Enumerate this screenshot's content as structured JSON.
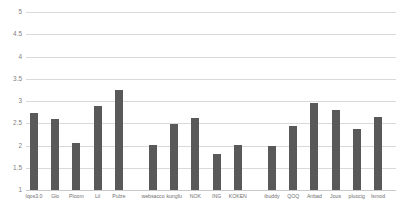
{
  "chart_data": {
    "type": "bar",
    "title": "",
    "subtitle": "",
    "xlabel": "",
    "ylabel": "",
    "ylim": [
      1,
      5
    ],
    "ytick_labels": [
      "1",
      "1.5",
      "2",
      "2.5",
      "3",
      "3.5",
      "4",
      "4.5",
      "5"
    ],
    "ytick_values": [
      1,
      1.5,
      2,
      2.5,
      3,
      3.5,
      4,
      4.5,
      5
    ],
    "grid": true,
    "legend": "none",
    "bar_color": "#595959",
    "gridline_color": "#d9d9d9",
    "background_color": "#ffffff",
    "groups": [
      {
        "name": "group-1",
        "categories": [
          "Iqos3.0",
          "Glo",
          "Ploom",
          "Lil",
          "Pulze"
        ],
        "values": [
          2.73,
          2.6,
          2.06,
          2.89,
          3.25
        ]
      },
      {
        "name": "group-2",
        "categories": [
          "websacco",
          "kungfu",
          "NOK",
          "ING",
          "KOKEN"
        ],
        "values": [
          2.01,
          2.48,
          2.62,
          1.82,
          2.01
        ]
      },
      {
        "name": "group-3",
        "categories": [
          "ibuddy",
          "QOQ",
          "Anbad",
          "Jous",
          "pluocig",
          "Ismod"
        ],
        "values": [
          2.0,
          2.44,
          2.96,
          2.79,
          2.36,
          2.63
        ]
      }
    ],
    "categories": [
      "Iqos3.0",
      "Glo",
      "Ploom",
      "Lil",
      "Pulze",
      "websacco",
      "kungfu",
      "NOK",
      "ING",
      "KOKEN",
      "ibuddy",
      "QOQ",
      "Anbad",
      "Jous",
      "pluocig",
      "Ismod"
    ],
    "values": [
      2.73,
      2.6,
      2.06,
      2.89,
      3.25,
      2.01,
      2.48,
      2.62,
      1.82,
      2.01,
      2.0,
      2.44,
      2.96,
      2.79,
      2.36,
      2.63
    ]
  }
}
